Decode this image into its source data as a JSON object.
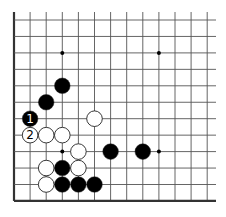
{
  "diagram": {
    "type": "go-board-fragment",
    "grid": {
      "origin_x": 14,
      "origin_y": 20,
      "spacing_x": 16.1,
      "spacing_y": 16.45,
      "cols": 13,
      "rows": 12,
      "right_extent": 216,
      "top_extent": 12,
      "edges": [
        "left",
        "bottom"
      ],
      "line_color": "#555555",
      "edge_color": "#333333"
    },
    "star_points": [
      {
        "col": 3,
        "row": 2
      },
      {
        "col": 9,
        "row": 2
      },
      {
        "col": 3,
        "row": 8
      },
      {
        "col": 9,
        "row": 8
      }
    ],
    "stones": [
      {
        "color": "black",
        "col": 3,
        "row": 4,
        "label": ""
      },
      {
        "color": "black",
        "col": 2,
        "row": 5,
        "label": ""
      },
      {
        "color": "black",
        "col": 1,
        "row": 6,
        "label": "1"
      },
      {
        "color": "white",
        "col": 5,
        "row": 6,
        "label": ""
      },
      {
        "color": "white",
        "col": 1,
        "row": 7,
        "label": "2"
      },
      {
        "color": "white",
        "col": 2,
        "row": 7,
        "label": ""
      },
      {
        "color": "white",
        "col": 3,
        "row": 7,
        "label": ""
      },
      {
        "color": "white",
        "col": 4,
        "row": 8,
        "label": ""
      },
      {
        "color": "black",
        "col": 6,
        "row": 8,
        "label": ""
      },
      {
        "color": "black",
        "col": 8,
        "row": 8,
        "label": ""
      },
      {
        "color": "white",
        "col": 2,
        "row": 9,
        "label": ""
      },
      {
        "color": "black",
        "col": 3,
        "row": 9,
        "label": ""
      },
      {
        "color": "white",
        "col": 4,
        "row": 9,
        "label": ""
      },
      {
        "color": "white",
        "col": 2,
        "row": 10,
        "label": ""
      },
      {
        "color": "black",
        "col": 3,
        "row": 10,
        "label": ""
      },
      {
        "color": "black",
        "col": 4,
        "row": 10,
        "label": ""
      },
      {
        "color": "black",
        "col": 5,
        "row": 10,
        "label": ""
      }
    ],
    "move_labels": {
      "move_1": "1",
      "move_2": "2"
    },
    "colors": {
      "black_stone": "#000000",
      "white_stone": "#ffffff",
      "stone_outline": "#222222",
      "background": "#ffffff"
    }
  }
}
